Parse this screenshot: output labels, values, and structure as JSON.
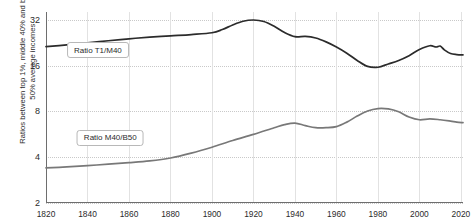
{
  "chart_data": {
    "type": "line",
    "title": "",
    "xlabel": "",
    "ylabel": "Ratios between top 1%, middle 40% and bottom 50% average incomes",
    "yscale": "log",
    "ylim": [
      2,
      36
    ],
    "xlim": [
      1820,
      2021
    ],
    "grid": true,
    "legend_position": "inline-labels",
    "yticks": [
      2,
      4,
      8,
      16,
      32
    ],
    "ytick_labels": [
      "2",
      "4",
      "8",
      "16",
      "32"
    ],
    "xticks": [
      1820,
      1840,
      1860,
      1880,
      1900,
      1920,
      1940,
      1960,
      1980,
      2000,
      2020
    ],
    "xtick_labels": [
      "1820",
      "1840",
      "1860",
      "1880",
      "1900",
      "1920",
      "1940",
      "1960",
      "1980",
      "2000",
      "2020"
    ],
    "series": [
      {
        "name": "Ratio T1/M40",
        "color": "#2b2b2b",
        "label_x": 1845,
        "label_y": 20.2,
        "x": [
          1820,
          1830,
          1840,
          1850,
          1860,
          1870,
          1880,
          1890,
          1900,
          1905,
          1910,
          1915,
          1920,
          1925,
          1930,
          1935,
          1940,
          1945,
          1950,
          1955,
          1960,
          1965,
          1970,
          1975,
          1980,
          1985,
          1990,
          1995,
          2000,
          2005,
          2008,
          2010,
          2012,
          2015,
          2018,
          2021
        ],
        "y": [
          21.3,
          21.9,
          22.6,
          23.3,
          24.0,
          24.6,
          25.1,
          25.6,
          26.3,
          27.6,
          29.6,
          31.3,
          31.9,
          31.2,
          29.0,
          26.4,
          24.8,
          24.9,
          24.3,
          22.9,
          21.2,
          19.3,
          17.3,
          15.8,
          15.6,
          16.4,
          17.3,
          18.6,
          20.4,
          21.6,
          21.2,
          21.5,
          20.3,
          19.2,
          18.9,
          18.8
        ]
      },
      {
        "name": "Ratio M40/B50",
        "color": "#787878",
        "label_x": 1851,
        "label_y": 5.35,
        "x": [
          1820,
          1830,
          1840,
          1850,
          1860,
          1870,
          1880,
          1890,
          1900,
          1910,
          1920,
          1930,
          1935,
          1940,
          1945,
          1950,
          1955,
          1960,
          1965,
          1970,
          1975,
          1980,
          1985,
          1990,
          1995,
          2000,
          2005,
          2010,
          2015,
          2018,
          2021
        ],
        "y": [
          3.4,
          3.45,
          3.52,
          3.6,
          3.68,
          3.78,
          3.95,
          4.25,
          4.65,
          5.15,
          5.65,
          6.25,
          6.55,
          6.7,
          6.45,
          6.25,
          6.25,
          6.35,
          6.8,
          7.45,
          8.05,
          8.35,
          8.3,
          7.95,
          7.35,
          7.05,
          7.15,
          7.05,
          6.9,
          6.8,
          6.75
        ]
      }
    ]
  }
}
